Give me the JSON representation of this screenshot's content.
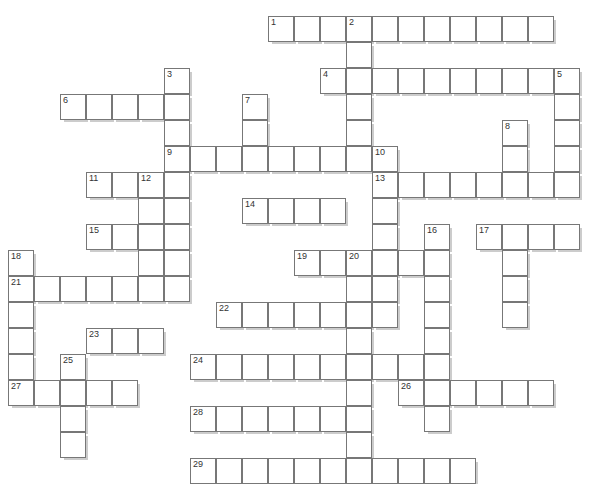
{
  "puzzle": {
    "title": "Crossword Puzzle Grid",
    "type": "crossword-grid",
    "cell_size_px": 26,
    "origin_x_px": 8,
    "origin_y_px": 16,
    "columns": 23,
    "rows": 17,
    "colors": {
      "cell_fill": "#ffffff",
      "cell_border": "#777777",
      "shadow": "rgba(0,0,0,0.20)",
      "number_text": "#333333",
      "background": "#ffffff"
    },
    "entries": [
      {
        "number": "1",
        "direction": "across",
        "col": 10,
        "row": 0,
        "length": 11
      },
      {
        "number": "2",
        "direction": "down",
        "col": 13,
        "row": 0,
        "length": 5
      },
      {
        "number": "3",
        "direction": "down",
        "col": 6,
        "row": 2,
        "length": 7
      },
      {
        "number": "4",
        "direction": "across",
        "col": 12,
        "row": 2,
        "length": 9
      },
      {
        "number": "5",
        "direction": "down",
        "col": 21,
        "row": 2,
        "length": 5
      },
      {
        "number": "6",
        "direction": "across",
        "col": 2,
        "row": 3,
        "length": 5
      },
      {
        "number": "7",
        "direction": "down",
        "col": 9,
        "row": 3,
        "length": 3
      },
      {
        "number": "8",
        "direction": "down",
        "col": 19,
        "row": 4,
        "length": 3
      },
      {
        "number": "9",
        "direction": "across",
        "col": 6,
        "row": 5,
        "length": 9
      },
      {
        "number": "10",
        "direction": "down",
        "col": 14,
        "row": 5,
        "length": 2
      },
      {
        "number": "11",
        "direction": "across",
        "col": 3,
        "row": 6,
        "length": 4
      },
      {
        "number": "12",
        "direction": "down",
        "col": 5,
        "row": 6,
        "length": 5
      },
      {
        "number": "13",
        "direction": "across",
        "col": 14,
        "row": 6,
        "length": 7
      },
      {
        "number": "14",
        "direction": "across",
        "col": 9,
        "row": 7,
        "length": 4
      },
      {
        "number": "15",
        "direction": "across",
        "col": 3,
        "row": 8,
        "length": 4
      },
      {
        "number": "16",
        "direction": "down",
        "col": 16,
        "row": 8,
        "length": 5
      },
      {
        "number": "17",
        "direction": "across",
        "col": 18,
        "row": 8,
        "length": 4
      },
      {
        "number": "18",
        "direction": "down",
        "col": 0,
        "row": 9,
        "length": 6
      },
      {
        "number": "19",
        "direction": "across",
        "col": 11,
        "row": 9,
        "length": 2
      },
      {
        "number": "20",
        "direction": "down",
        "col": 13,
        "row": 9,
        "length": 5
      },
      {
        "number": "21",
        "direction": "across",
        "col": 0,
        "row": 10,
        "length": 7
      },
      {
        "number": "22",
        "direction": "across",
        "col": 8,
        "row": 11,
        "length": 7
      },
      {
        "number": "23",
        "direction": "across",
        "col": 3,
        "row": 12,
        "length": 3
      },
      {
        "number": "24",
        "direction": "across",
        "col": 7,
        "row": 13,
        "length": 9
      },
      {
        "number": "25",
        "direction": "down",
        "col": 2,
        "row": 13,
        "length": 5
      },
      {
        "number": "26",
        "direction": "across",
        "col": 15,
        "row": 14,
        "length": 6
      },
      {
        "number": "27",
        "direction": "across",
        "col": 0,
        "row": 14,
        "length": 5
      },
      {
        "number": "28",
        "direction": "across",
        "col": 7,
        "row": 15,
        "length": 7
      },
      {
        "number": "29",
        "direction": "across",
        "col": 7,
        "row": 17,
        "length": 11
      }
    ],
    "cells": [
      {
        "c": 10,
        "r": 0,
        "n": "1"
      },
      {
        "c": 11,
        "r": 0
      },
      {
        "c": 12,
        "r": 0
      },
      {
        "c": 13,
        "r": 0,
        "n": "2"
      },
      {
        "c": 14,
        "r": 0
      },
      {
        "c": 15,
        "r": 0
      },
      {
        "c": 16,
        "r": 0
      },
      {
        "c": 17,
        "r": 0
      },
      {
        "c": 18,
        "r": 0
      },
      {
        "c": 19,
        "r": 0
      },
      {
        "c": 20,
        "r": 0
      },
      {
        "c": 13,
        "r": 1
      },
      {
        "c": 6,
        "r": 2,
        "n": "3"
      },
      {
        "c": 12,
        "r": 2,
        "n": "4"
      },
      {
        "c": 13,
        "r": 2
      },
      {
        "c": 14,
        "r": 2
      },
      {
        "c": 15,
        "r": 2
      },
      {
        "c": 16,
        "r": 2
      },
      {
        "c": 17,
        "r": 2
      },
      {
        "c": 18,
        "r": 2
      },
      {
        "c": 19,
        "r": 2
      },
      {
        "c": 20,
        "r": 2
      },
      {
        "c": 21,
        "r": 2,
        "n": "5"
      },
      {
        "c": 2,
        "r": 3,
        "n": "6"
      },
      {
        "c": 3,
        "r": 3
      },
      {
        "c": 4,
        "r": 3
      },
      {
        "c": 5,
        "r": 3
      },
      {
        "c": 6,
        "r": 3
      },
      {
        "c": 9,
        "r": 3,
        "n": "7"
      },
      {
        "c": 13,
        "r": 3
      },
      {
        "c": 21,
        "r": 3
      },
      {
        "c": 6,
        "r": 4
      },
      {
        "c": 9,
        "r": 4
      },
      {
        "c": 13,
        "r": 4
      },
      {
        "c": 19,
        "r": 4,
        "n": "8"
      },
      {
        "c": 21,
        "r": 4
      },
      {
        "c": 6,
        "r": 5,
        "n": "9"
      },
      {
        "c": 7,
        "r": 5
      },
      {
        "c": 8,
        "r": 5
      },
      {
        "c": 9,
        "r": 5
      },
      {
        "c": 10,
        "r": 5
      },
      {
        "c": 11,
        "r": 5
      },
      {
        "c": 12,
        "r": 5
      },
      {
        "c": 13,
        "r": 5
      },
      {
        "c": 14,
        "r": 5,
        "n": "10"
      },
      {
        "c": 19,
        "r": 5
      },
      {
        "c": 21,
        "r": 5
      },
      {
        "c": 3,
        "r": 6,
        "n": "11"
      },
      {
        "c": 4,
        "r": 6
      },
      {
        "c": 5,
        "r": 6,
        "n": "12"
      },
      {
        "c": 6,
        "r": 6
      },
      {
        "c": 14,
        "r": 6,
        "n": "13"
      },
      {
        "c": 15,
        "r": 6
      },
      {
        "c": 16,
        "r": 6
      },
      {
        "c": 17,
        "r": 6
      },
      {
        "c": 18,
        "r": 6
      },
      {
        "c": 19,
        "r": 6
      },
      {
        "c": 20,
        "r": 6
      },
      {
        "c": 21,
        "r": 6
      },
      {
        "c": 5,
        "r": 7
      },
      {
        "c": 6,
        "r": 7
      },
      {
        "c": 9,
        "r": 7,
        "n": "14"
      },
      {
        "c": 10,
        "r": 7
      },
      {
        "c": 11,
        "r": 7
      },
      {
        "c": 12,
        "r": 7
      },
      {
        "c": 14,
        "r": 7
      },
      {
        "c": 3,
        "r": 8,
        "n": "15"
      },
      {
        "c": 4,
        "r": 8
      },
      {
        "c": 5,
        "r": 8
      },
      {
        "c": 6,
        "r": 8
      },
      {
        "c": 14,
        "r": 8
      },
      {
        "c": 16,
        "r": 8,
        "n": "16"
      },
      {
        "c": 18,
        "r": 8,
        "n": "17"
      },
      {
        "c": 19,
        "r": 8
      },
      {
        "c": 20,
        "r": 8
      },
      {
        "c": 21,
        "r": 8
      },
      {
        "c": 0,
        "r": 9,
        "n": "18"
      },
      {
        "c": 5,
        "r": 9
      },
      {
        "c": 6,
        "r": 9
      },
      {
        "c": 11,
        "r": 9,
        "n": "19"
      },
      {
        "c": 12,
        "r": 9
      },
      {
        "c": 13,
        "r": 9,
        "n": "20"
      },
      {
        "c": 14,
        "r": 9
      },
      {
        "c": 15,
        "r": 9
      },
      {
        "c": 16,
        "r": 9
      },
      {
        "c": 19,
        "r": 9
      },
      {
        "c": 0,
        "r": 10,
        "n": "21"
      },
      {
        "c": 1,
        "r": 10
      },
      {
        "c": 2,
        "r": 10
      },
      {
        "c": 3,
        "r": 10
      },
      {
        "c": 4,
        "r": 10
      },
      {
        "c": 5,
        "r": 10
      },
      {
        "c": 6,
        "r": 10
      },
      {
        "c": 13,
        "r": 10
      },
      {
        "c": 14,
        "r": 10
      },
      {
        "c": 16,
        "r": 10
      },
      {
        "c": 19,
        "r": 10
      },
      {
        "c": 0,
        "r": 11
      },
      {
        "c": 8,
        "r": 11,
        "n": "22"
      },
      {
        "c": 9,
        "r": 11
      },
      {
        "c": 10,
        "r": 11
      },
      {
        "c": 11,
        "r": 11
      },
      {
        "c": 12,
        "r": 11
      },
      {
        "c": 13,
        "r": 11
      },
      {
        "c": 14,
        "r": 11
      },
      {
        "c": 16,
        "r": 11
      },
      {
        "c": 19,
        "r": 11
      },
      {
        "c": 0,
        "r": 12
      },
      {
        "c": 3,
        "r": 12,
        "n": "23"
      },
      {
        "c": 4,
        "r": 12
      },
      {
        "c": 5,
        "r": 12
      },
      {
        "c": 13,
        "r": 12
      },
      {
        "c": 16,
        "r": 12
      },
      {
        "c": 0,
        "r": 13
      },
      {
        "c": 2,
        "r": 13,
        "n": "25"
      },
      {
        "c": 7,
        "r": 13,
        "n": "24"
      },
      {
        "c": 8,
        "r": 13
      },
      {
        "c": 9,
        "r": 13
      },
      {
        "c": 10,
        "r": 13
      },
      {
        "c": 11,
        "r": 13
      },
      {
        "c": 12,
        "r": 13
      },
      {
        "c": 13,
        "r": 13
      },
      {
        "c": 14,
        "r": 13
      },
      {
        "c": 15,
        "r": 13
      },
      {
        "c": 16,
        "r": 13
      },
      {
        "c": 0,
        "r": 14,
        "n": "27"
      },
      {
        "c": 1,
        "r": 14
      },
      {
        "c": 2,
        "r": 14
      },
      {
        "c": 3,
        "r": 14
      },
      {
        "c": 4,
        "r": 14
      },
      {
        "c": 13,
        "r": 14
      },
      {
        "c": 15,
        "r": 14,
        "n": "26"
      },
      {
        "c": 16,
        "r": 14
      },
      {
        "c": 17,
        "r": 14
      },
      {
        "c": 18,
        "r": 14
      },
      {
        "c": 19,
        "r": 14
      },
      {
        "c": 20,
        "r": 14
      },
      {
        "c": 2,
        "r": 15
      },
      {
        "c": 7,
        "r": 15,
        "n": "28"
      },
      {
        "c": 8,
        "r": 15
      },
      {
        "c": 9,
        "r": 15
      },
      {
        "c": 10,
        "r": 15
      },
      {
        "c": 11,
        "r": 15
      },
      {
        "c": 12,
        "r": 15
      },
      {
        "c": 13,
        "r": 15
      },
      {
        "c": 16,
        "r": 15
      },
      {
        "c": 2,
        "r": 16
      },
      {
        "c": 13,
        "r": 16
      },
      {
        "c": 7,
        "r": 17,
        "n": "29"
      },
      {
        "c": 8,
        "r": 17
      },
      {
        "c": 9,
        "r": 17
      },
      {
        "c": 10,
        "r": 17
      },
      {
        "c": 11,
        "r": 17
      },
      {
        "c": 12,
        "r": 17
      },
      {
        "c": 13,
        "r": 17
      },
      {
        "c": 14,
        "r": 17
      },
      {
        "c": 15,
        "r": 17
      },
      {
        "c": 16,
        "r": 17
      },
      {
        "c": 17,
        "r": 17
      }
    ]
  }
}
